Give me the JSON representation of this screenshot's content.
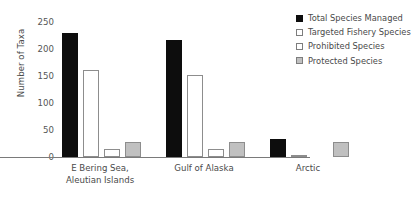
{
  "chart_data": {
    "type": "bar",
    "title": "",
    "xlabel": "",
    "ylabel": "Number of Taxa",
    "ylim": [
      0,
      250
    ],
    "yticks": [
      0,
      50,
      100,
      150,
      200,
      250
    ],
    "grid": false,
    "legend_position": "top-right",
    "categories": [
      "E Bering Sea,\nAleutian Islands",
      "Gulf of Alaska",
      "Arctic"
    ],
    "series": [
      {
        "name": "Total Species Managed",
        "color": "#0d0d0d",
        "values": [
          230,
          216,
          33
        ]
      },
      {
        "name": "Targeted Fishery Species",
        "color": "#ffffff",
        "values": [
          161,
          152,
          3
        ]
      },
      {
        "name": "Prohibited Species",
        "color": "#ffffff",
        "values": [
          15,
          15,
          0
        ]
      },
      {
        "name": "Protected Species",
        "color": "#c0c0c0",
        "values": [
          28,
          28,
          28
        ]
      }
    ]
  },
  "axis": {
    "y_title": "Number of Taxa",
    "y_tick_labels": [
      "0",
      "50",
      "100",
      "150",
      "200",
      "250"
    ]
  },
  "x_axis": {
    "labels": [
      "E Bering Sea,\nAleutian Islands",
      "Gulf of Alaska",
      "Arctic"
    ]
  },
  "legend": {
    "items": [
      {
        "label": "Total Species Managed",
        "swatch": "filled-black-square"
      },
      {
        "label": "Targeted Fishery Species",
        "swatch": "open-square"
      },
      {
        "label": "Prohibited Species",
        "swatch": "open-square"
      },
      {
        "label": "Protected Species",
        "swatch": "filled-gray-square"
      }
    ]
  }
}
